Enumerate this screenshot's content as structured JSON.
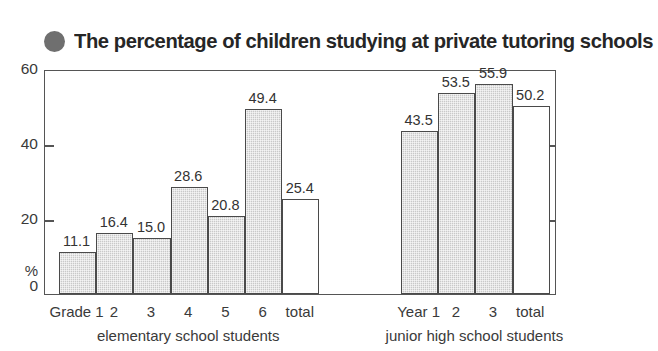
{
  "title": {
    "text": "The percentage of children studying at private tutoring schools",
    "bullet_icon": "filled-circle-icon",
    "bullet_color": "#6f6f6f"
  },
  "axis": {
    "y_unit": "%",
    "y_ticks": [
      "0",
      "20",
      "40",
      "60"
    ],
    "y_tick_60": "60",
    "y_tick_40": "40",
    "y_tick_20": "20",
    "y_tick_0": "0"
  },
  "chart_data": {
    "type": "bar",
    "title": "The percentage of children studying at private tutoring schools",
    "xlabel": "",
    "ylabel": "%",
    "ylim": [
      0,
      60
    ],
    "ytick_values": [
      0,
      20,
      40,
      60
    ],
    "grid": false,
    "legend": "none",
    "groups": [
      {
        "name": "elementary school students",
        "categories": [
          "Grade 1",
          "2",
          "3",
          "4",
          "5",
          "6",
          "total"
        ],
        "values": [
          11.1,
          16.4,
          15.0,
          28.6,
          20.8,
          49.4,
          25.4
        ],
        "labels": [
          "11.1",
          "16.4",
          "15.0",
          "28.6",
          "20.8",
          "49.4",
          "25.4"
        ],
        "styles": [
          "filled",
          "filled",
          "filled",
          "filled",
          "filled",
          "filled",
          "open"
        ]
      },
      {
        "name": "junior high school students",
        "categories": [
          "Year 1",
          "2",
          "3",
          "total"
        ],
        "values": [
          43.5,
          53.5,
          55.9,
          50.2
        ],
        "labels": [
          "43.5",
          "53.5",
          "55.9",
          "50.2"
        ],
        "styles": [
          "filled",
          "filled",
          "filled",
          "open"
        ]
      }
    ],
    "colors": {
      "bar_fill": "#c9c9c9",
      "bar_stroke": "#4a4a4a",
      "open_bar_fill": "#ffffff",
      "frame": "#555555",
      "text": "#333333"
    }
  }
}
